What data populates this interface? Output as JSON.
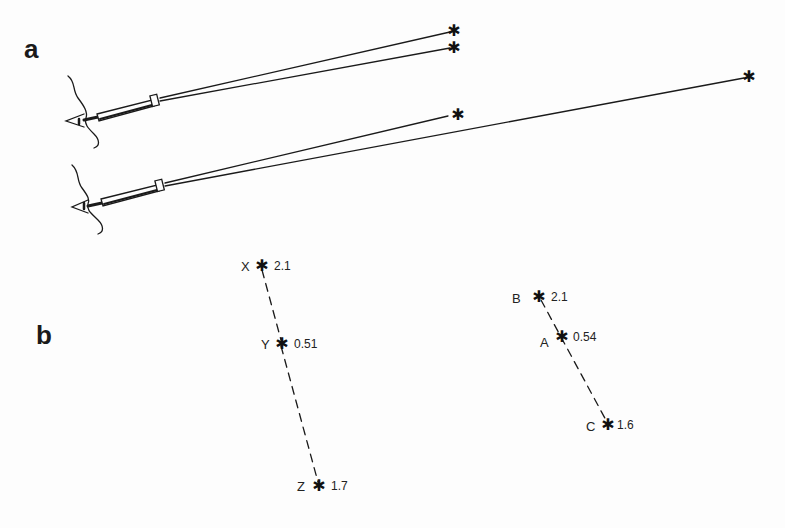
{
  "figure": {
    "panel_a": {
      "label": "a",
      "description": "Two observers looking through telescopes at pairs of stars",
      "upper_telescope": {
        "targets": [
          {
            "name": "star-upper-1",
            "symbol": "✱"
          },
          {
            "name": "star-upper-2",
            "symbol": "✱"
          }
        ]
      },
      "lower_telescope": {
        "targets": [
          {
            "name": "star-near",
            "symbol": "✱"
          },
          {
            "name": "star-far",
            "symbol": "✱"
          }
        ]
      }
    },
    "panel_b": {
      "label": "b",
      "left_group": [
        {
          "name": "X",
          "value": "2.1"
        },
        {
          "name": "Y",
          "value": "0.51"
        },
        {
          "name": "Z",
          "value": "1.7"
        }
      ],
      "right_group": [
        {
          "name": "B",
          "value": "2.1"
        },
        {
          "name": "A",
          "value": "0.54"
        },
        {
          "name": "C",
          "value": "1.6"
        }
      ]
    },
    "colors": {
      "ink": "#1a1a1a",
      "paper": "#fdfdfd"
    }
  }
}
